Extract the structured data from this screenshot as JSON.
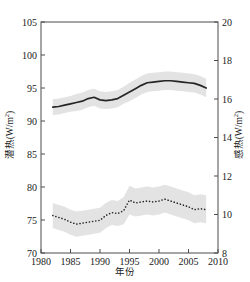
{
  "chart_data": {
    "type": "line",
    "title": "",
    "xlabel": "年份",
    "ylabel_left": "潜热(W/m2)",
    "ylabel_right": "感热(W/m2)",
    "xlim": [
      1980,
      2010
    ],
    "xticks": [
      1980,
      1985,
      1990,
      1995,
      2000,
      2005,
      2010
    ],
    "ylim_left": [
      70,
      105
    ],
    "yticks_left": [
      70,
      75,
      80,
      85,
      90,
      95,
      100,
      105
    ],
    "ylim_right": [
      8,
      20
    ],
    "yticks_right": [
      8,
      10,
      12,
      14,
      16,
      18,
      20
    ],
    "grid": false,
    "legend": "none",
    "x": [
      1982,
      1983,
      1984,
      1985,
      1986,
      1987,
      1988,
      1989,
      1990,
      1991,
      1992,
      1993,
      1994,
      1995,
      1996,
      1997,
      1998,
      1999,
      2000,
      2001,
      2002,
      2003,
      2004,
      2005,
      2006,
      2007,
      2008
    ],
    "series": [
      {
        "name": "潜热(W/m2)",
        "axis": "left",
        "style": "solid",
        "color": "#262626",
        "band_color": "#e3e3e3",
        "values": [
          92.1,
          92.2,
          92.4,
          92.6,
          92.8,
          93.0,
          93.4,
          93.6,
          93.2,
          93.1,
          93.2,
          93.4,
          93.9,
          94.4,
          94.9,
          95.4,
          95.8,
          95.9,
          96.0,
          96.1,
          96.1,
          96.0,
          95.9,
          95.8,
          95.7,
          95.4,
          95.0
        ],
        "band_lower": [
          90.9,
          91.0,
          91.2,
          91.4,
          91.5,
          91.7,
          92.1,
          92.3,
          91.9,
          91.8,
          91.9,
          92.1,
          92.6,
          93.0,
          93.5,
          94.0,
          94.4,
          94.5,
          94.6,
          94.7,
          94.7,
          94.6,
          94.5,
          94.4,
          94.3,
          94.0,
          93.6
        ],
        "band_upper": [
          93.3,
          93.4,
          93.6,
          93.8,
          94.1,
          94.3,
          94.7,
          94.9,
          94.5,
          94.4,
          94.5,
          94.7,
          95.2,
          95.8,
          96.3,
          96.8,
          97.2,
          97.3,
          97.4,
          97.5,
          97.5,
          97.4,
          97.3,
          97.2,
          97.1,
          96.8,
          96.4
        ]
      },
      {
        "name": "感热(W/m2)",
        "axis": "right",
        "style": "dotted",
        "color": "#262626",
        "band_color": "#e3e3e3",
        "values": [
          9.95,
          9.85,
          9.75,
          9.6,
          9.5,
          9.55,
          9.6,
          9.65,
          9.7,
          9.95,
          10.1,
          10.05,
          10.2,
          10.75,
          10.6,
          10.65,
          10.7,
          10.65,
          10.7,
          10.8,
          10.7,
          10.6,
          10.5,
          10.4,
          10.25,
          10.3,
          10.25
        ],
        "band_lower": [
          9.3,
          9.2,
          9.1,
          8.95,
          8.85,
          8.9,
          8.95,
          9.0,
          9.05,
          9.3,
          9.45,
          9.4,
          9.5,
          10.0,
          9.9,
          9.95,
          10.0,
          9.95,
          10.0,
          10.1,
          10.0,
          9.9,
          9.8,
          9.7,
          9.55,
          9.6,
          9.55
        ],
        "band_upper": [
          10.6,
          10.5,
          10.4,
          10.25,
          10.15,
          10.2,
          10.25,
          10.3,
          10.35,
          10.6,
          10.75,
          10.7,
          10.9,
          11.5,
          11.35,
          11.4,
          11.45,
          11.4,
          11.45,
          11.55,
          11.45,
          11.35,
          11.25,
          11.15,
          11.0,
          11.05,
          11.0
        ]
      }
    ]
  },
  "axes": {
    "left_title_main": "潜热(W/m",
    "left_title_sup": "2",
    "left_title_end": ")",
    "right_title_main": "感热(W/m",
    "right_title_sup": "2",
    "right_title_end": ")",
    "bottom_title": "年份"
  }
}
